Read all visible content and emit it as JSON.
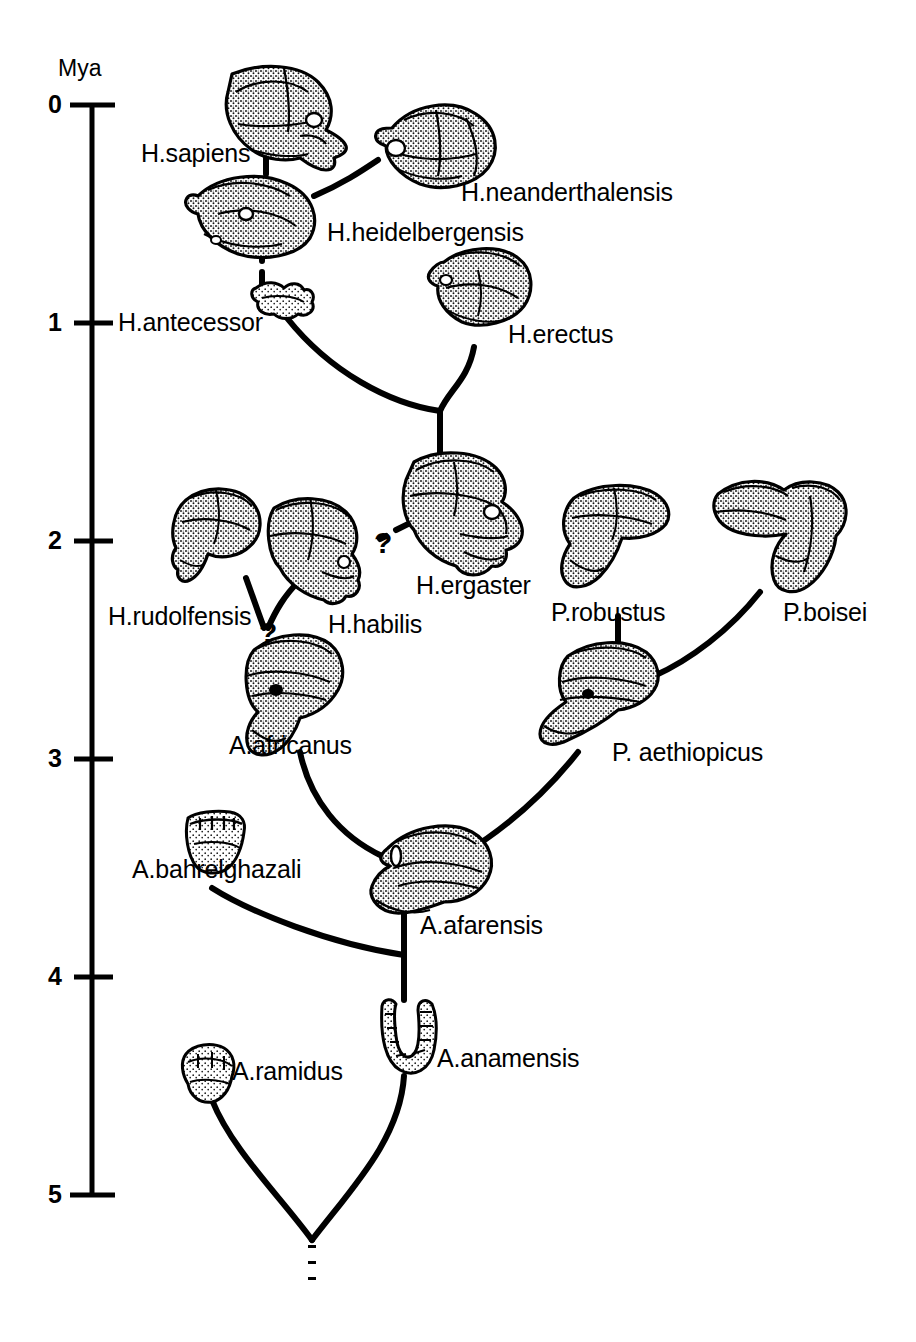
{
  "figure": {
    "type": "phylogenetic-tree",
    "axis": {
      "title": "Mya",
      "orientation": "vertical",
      "ticks": [
        "0",
        "1",
        "2",
        "3",
        "4",
        "5"
      ],
      "range_mya": [
        0,
        5
      ]
    },
    "root_marker": "dotted-stem"
  },
  "taxa": [
    {
      "id": "sapiens",
      "label": "H.sapiens",
      "mya": 0.25,
      "specimen": "cranium"
    },
    {
      "id": "neanderthalensis",
      "label": "H.neanderthalensis",
      "mya": 0.35,
      "specimen": "cranium"
    },
    {
      "id": "heidelbergensis",
      "label": "H.heidelbergensis",
      "mya": 0.62,
      "specimen": "cranium"
    },
    {
      "id": "antecessor",
      "label": "H.antecessor",
      "mya": 0.93,
      "specimen": "fragment"
    },
    {
      "id": "erectus",
      "label": "H.erectus",
      "mya": 0.86,
      "specimen": "cranium"
    },
    {
      "id": "ergaster",
      "label": "H.ergaster",
      "mya": 1.72,
      "specimen": "cranium"
    },
    {
      "id": "rudolfensis",
      "label": "H.rudolfensis",
      "mya": 1.92,
      "specimen": "cranium"
    },
    {
      "id": "habilis",
      "label": "H.habilis",
      "mya": 2.02,
      "specimen": "cranium"
    },
    {
      "id": "robustus",
      "label": "P.robustus",
      "mya": 1.92,
      "specimen": "cranium"
    },
    {
      "id": "boisei",
      "label": "P.boisei",
      "mya": 1.9,
      "specimen": "cranium"
    },
    {
      "id": "africanus",
      "label": "A.africanus",
      "mya": 2.62,
      "specimen": "cranium"
    },
    {
      "id": "aethiopicus",
      "label": "P. aethiopicus",
      "mya": 2.68,
      "specimen": "cranium"
    },
    {
      "id": "bahrelghazali",
      "label": "A.bahrelghazali",
      "mya": 3.4,
      "specimen": "maxilla"
    },
    {
      "id": "afarensis",
      "label": "A.afarensis",
      "mya": 3.55,
      "specimen": "cranium"
    },
    {
      "id": "anamensis",
      "label": "A.anamensis",
      "mya": 4.2,
      "specimen": "mandible"
    },
    {
      "id": "ramidus",
      "label": "A.ramidus",
      "mya": 4.4,
      "specimen": "fragment"
    }
  ],
  "links": [
    {
      "from": "heidelbergensis",
      "to": "sapiens",
      "style": "solid"
    },
    {
      "from": "heidelbergensis",
      "to": "neanderthalensis",
      "style": "solid"
    },
    {
      "from": "heidelbergensis",
      "to": "antecessor",
      "style": "dashed"
    },
    {
      "from": "ergaster",
      "to": "antecessor",
      "style": "solid"
    },
    {
      "from": "ergaster",
      "to": "erectus",
      "style": "solid"
    },
    {
      "from": "habilis",
      "to": "ergaster",
      "style": "dashed-uncertain",
      "annotation": "?"
    },
    {
      "from": "africanus",
      "to": "habilis",
      "style": "dashed-uncertain",
      "annotation": "?"
    },
    {
      "from": "africanus",
      "to": "rudolfensis",
      "style": "solid"
    },
    {
      "from": "afarensis",
      "to": "africanus",
      "style": "solid"
    },
    {
      "from": "afarensis",
      "to": "aethiopicus",
      "style": "solid"
    },
    {
      "from": "aethiopicus",
      "to": "robustus",
      "style": "solid"
    },
    {
      "from": "aethiopicus",
      "to": "boisei",
      "style": "solid"
    },
    {
      "from": "anamensis",
      "to": "afarensis",
      "style": "solid"
    },
    {
      "from": "anamensis",
      "to": "bahrelghazali",
      "style": "solid"
    },
    {
      "from": "root",
      "to": "anamensis",
      "style": "solid"
    },
    {
      "from": "root",
      "to": "ramidus",
      "style": "solid"
    }
  ],
  "annotations": {
    "question_mark_1": "?",
    "question_mark_2": "?"
  },
  "colors": {
    "ink": "#000000",
    "paper": "#ffffff",
    "stipple": "#111111"
  }
}
